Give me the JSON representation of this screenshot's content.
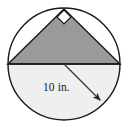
{
  "figure": {
    "kind": "geometry-diagram",
    "background_color": "#ffffff"
  },
  "circle": {
    "name": "circle",
    "center_x": 64,
    "center_y": 64,
    "radius": 56,
    "stroke_color": "#1a1a1a",
    "stroke_width": 1.4,
    "upper_fill": "#ffffff",
    "lower_half_fill": "#efefef"
  },
  "triangle": {
    "name": "inscribed-right-triangle",
    "fill_color": "#9a9a9a",
    "stroke_color": "#1a1a1a",
    "stroke_width": 1.4,
    "vertices": [
      {
        "label": "left-base-vertex",
        "x": 8,
        "y": 64
      },
      {
        "label": "apex-vertex",
        "x": 64,
        "y": 9
      },
      {
        "label": "right-base-vertex",
        "x": 120,
        "y": 64
      }
    ]
  },
  "right_angle_marker": {
    "name": "right-angle-marker",
    "at_x": 64,
    "at_y": 17,
    "size": 7,
    "fill_color": "#ffffff",
    "stroke_color": "#1a1a1a"
  },
  "diameter_line": {
    "name": "horizontal-diameter",
    "x1": 8,
    "y1": 64,
    "x2": 120,
    "y2": 64,
    "stroke_color": "#1a1a1a"
  },
  "radius_arrow": {
    "name": "radius-arrow",
    "x1": 64,
    "y1": 64,
    "x2": 103,
    "y2": 103,
    "stroke_color": "#3a3a3a",
    "label": "10 in.",
    "label_x": 43,
    "label_y": 91
  }
}
